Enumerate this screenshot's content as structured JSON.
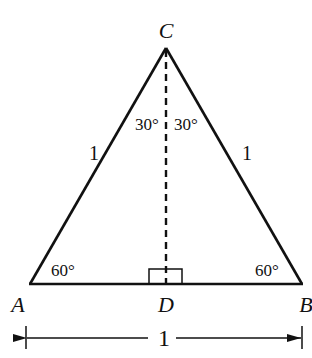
{
  "diagram": {
    "vertices": {
      "A": {
        "label": "A"
      },
      "B": {
        "label": "B"
      },
      "C": {
        "label": "C"
      },
      "D": {
        "label": "D"
      }
    },
    "sides": {
      "AC": "1",
      "BC": "1",
      "AB_dimension": "1"
    },
    "angles": {
      "A": "60°",
      "B": "60°",
      "ACD": "30°",
      "BCD": "30°"
    },
    "right_angle_at": "D",
    "colors": {
      "stroke": "#111111",
      "background": "#ffffff"
    }
  }
}
